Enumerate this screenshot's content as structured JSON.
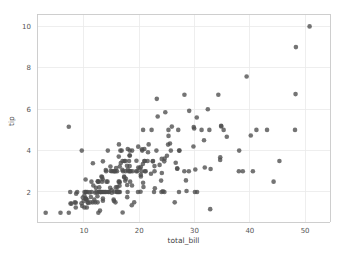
{
  "chart_data": {
    "type": "scatter",
    "title": "",
    "subtitle": "",
    "xlabel": "total_bill",
    "ylabel": "tip",
    "xlim": [
      1.5,
      54.5
    ],
    "ylim": [
      0.55,
      10.6
    ],
    "xticks": [
      10,
      20,
      30,
      40,
      50
    ],
    "xticklabels": [
      "10",
      "20",
      "30",
      "40",
      "50"
    ],
    "yticks": [
      2,
      4,
      6,
      8,
      10
    ],
    "yticklabels": [
      "2",
      "4",
      "6",
      "8",
      "10"
    ],
    "grid": true,
    "grid_axis": "both",
    "legend": null,
    "legend_position": "none",
    "marker": "circle",
    "marker_size_px": 4.6,
    "marker_color": "#4d4d4d",
    "marker_opacity": 0.78,
    "background_color": "#ffffff",
    "grid_color": "#eaeaea",
    "spine_color": "#c9c9c9",
    "n_points": 244,
    "series": [
      {
        "name": "tips",
        "x": [
          16.99,
          10.34,
          21.01,
          23.68,
          24.59,
          25.29,
          8.77,
          26.88,
          15.04,
          14.78,
          10.27,
          35.26,
          15.42,
          18.43,
          14.83,
          21.58,
          10.33,
          16.29,
          16.97,
          20.65,
          17.92,
          20.29,
          15.77,
          39.42,
          19.82,
          17.81,
          13.37,
          12.69,
          21.7,
          19.65,
          9.55,
          18.35,
          15.06,
          20.69,
          17.78,
          24.06,
          16.31,
          16.93,
          18.69,
          31.27,
          16.04,
          17.46,
          13.94,
          9.68,
          30.4,
          18.29,
          22.23,
          32.4,
          28.55,
          18.04,
          12.54,
          10.29,
          34.81,
          9.94,
          25.56,
          19.49,
          38.01,
          26.41,
          11.24,
          48.27,
          20.29,
          13.81,
          11.02,
          18.29,
          17.59,
          20.08,
          16.45,
          3.07,
          20.23,
          15.01,
          12.02,
          17.07,
          26.86,
          25.28,
          14.73,
          10.51,
          17.92,
          27.2,
          22.76,
          17.29,
          19.44,
          16.66,
          10.07,
          32.68,
          15.98,
          34.83,
          13.03,
          18.28,
          24.71,
          21.16,
          28.97,
          22.49,
          5.75,
          16.32,
          22.75,
          40.17,
          27.28,
          12.03,
          21.01,
          12.46,
          11.35,
          15.38,
          44.3,
          22.42,
          20.92,
          15.36,
          20.49,
          25.21,
          18.24,
          14.31,
          14.0,
          7.25,
          38.07,
          23.95,
          25.71,
          17.31,
          29.93,
          10.65,
          12.43,
          24.08,
          11.69,
          13.42,
          14.26,
          15.95,
          12.48,
          29.8,
          8.52,
          14.52,
          11.38,
          22.82,
          19.08,
          20.27,
          11.17,
          12.26,
          18.26,
          8.51,
          10.33,
          14.15,
          16.0,
          13.16,
          17.47,
          34.3,
          41.19,
          27.05,
          16.43,
          8.35,
          18.64,
          11.87,
          9.78,
          7.51,
          14.07,
          13.13,
          17.26,
          24.55,
          19.77,
          29.85,
          48.17,
          25.0,
          13.39,
          16.49,
          21.5,
          12.66,
          16.21,
          13.81,
          17.51,
          24.52,
          20.76,
          31.71,
          10.59,
          10.63,
          50.81,
          15.81,
          7.25,
          31.85,
          16.82,
          32.9,
          17.89,
          14.48,
          9.6,
          34.63,
          34.65,
          23.33,
          45.35,
          23.17,
          40.55,
          20.69,
          20.9,
          30.46,
          18.15,
          23.1,
          15.69,
          19.81,
          28.44,
          15.48,
          16.58,
          7.56,
          10.34,
          43.11,
          13.0,
          13.51,
          18.71,
          12.74,
          13.0,
          16.4,
          20.53,
          16.47,
          26.59,
          38.73,
          24.27,
          12.76,
          30.06,
          25.89,
          48.33,
          13.27,
          28.17,
          12.9,
          28.15,
          11.59,
          7.74,
          30.14,
          12.16,
          13.42,
          8.58,
          15.98,
          13.42,
          16.27,
          10.09,
          20.45,
          13.28,
          22.12,
          24.01,
          15.69,
          11.61,
          10.77,
          15.53,
          10.07,
          12.6,
          32.83,
          35.83,
          29.03,
          27.18,
          22.67,
          17.82,
          18.78
        ],
        "y": [
          1.01,
          1.66,
          3.5,
          3.31,
          3.61,
          4.71,
          2.0,
          3.12,
          1.96,
          3.23,
          1.71,
          5.0,
          1.57,
          3.0,
          3.02,
          3.92,
          1.67,
          3.71,
          3.5,
          3.35,
          4.08,
          2.75,
          2.23,
          7.58,
          3.18,
          2.34,
          2.0,
          2.0,
          4.3,
          3.0,
          1.45,
          2.5,
          3.0,
          2.45,
          3.27,
          3.6,
          2.0,
          3.07,
          2.31,
          5.0,
          2.24,
          2.54,
          3.06,
          1.32,
          5.6,
          3.0,
          5.0,
          6.0,
          2.05,
          3.0,
          2.5,
          2.6,
          5.2,
          1.56,
          4.34,
          3.51,
          3.0,
          1.5,
          1.76,
          6.73,
          3.21,
          2.0,
          1.98,
          3.76,
          2.64,
          3.15,
          2.47,
          1.0,
          2.01,
          2.09,
          1.97,
          3.0,
          3.14,
          5.0,
          2.2,
          1.25,
          3.08,
          4.0,
          3.0,
          2.71,
          3.0,
          3.4,
          1.83,
          5.0,
          2.03,
          5.17,
          2.0,
          4.0,
          5.85,
          3.0,
          3.0,
          3.5,
          1.0,
          4.3,
          3.25,
          4.73,
          4.0,
          1.5,
          3.0,
          1.5,
          2.5,
          3.0,
          2.5,
          3.48,
          4.08,
          1.64,
          4.06,
          4.29,
          3.76,
          4.0,
          3.0,
          1.0,
          4.0,
          2.55,
          4.0,
          3.5,
          5.07,
          1.5,
          1.8,
          2.92,
          2.31,
          1.68,
          2.5,
          2.0,
          2.52,
          4.2,
          1.48,
          2.0,
          2.0,
          2.18,
          1.5,
          2.83,
          1.5,
          2.0,
          3.25,
          1.25,
          2.0,
          2.0,
          2.0,
          2.75,
          3.5,
          6.7,
          5.0,
          5.0,
          2.3,
          1.5,
          1.36,
          1.63,
          1.73,
          2.0,
          2.5,
          2.0,
          2.74,
          2.0,
          2.0,
          5.14,
          5.0,
          3.75,
          2.61,
          2.0,
          3.5,
          2.5,
          2.0,
          2.0,
          3.0,
          3.48,
          2.24,
          4.5,
          1.61,
          2.0,
          10.0,
          3.16,
          5.15,
          3.18,
          4.0,
          3.11,
          2.0,
          2.0,
          4.0,
          3.55,
          3.68,
          5.65,
          3.5,
          6.5,
          3.0,
          5.0,
          3.5,
          2.0,
          3.5,
          4.0,
          1.5,
          4.19,
          2.56,
          2.02,
          4.0,
          1.44,
          2.0,
          5.0,
          2.0,
          2.0,
          4.0,
          2.01,
          2.0,
          2.5,
          4.0,
          3.23,
          3.41,
          3.0,
          2.03,
          2.23,
          2.0,
          5.16,
          9.0,
          2.5,
          6.7,
          1.1,
          3.0,
          1.5,
          1.44,
          3.09,
          2.2,
          3.48,
          1.92,
          3.0,
          1.58,
          2.5,
          2.0,
          3.0,
          2.72,
          2.88,
          2.0,
          3.0,
          3.39,
          1.47,
          3.0,
          1.25,
          1.0,
          1.17,
          4.67,
          5.92,
          2.0,
          2.0,
          1.75,
          3.0
        ]
      }
    ]
  }
}
